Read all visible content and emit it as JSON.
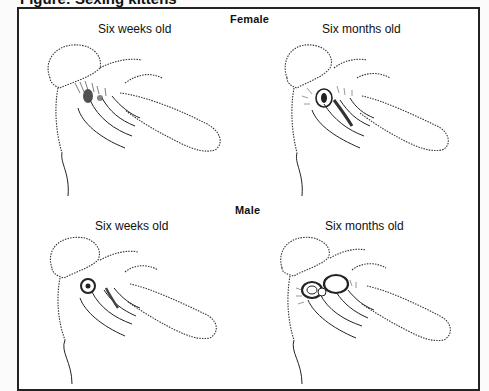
{
  "figure": {
    "title_cropped": "Figure: Sexing kittens",
    "sections": [
      {
        "label": "Female",
        "panels": [
          {
            "label": "Six weeks old"
          },
          {
            "label": "Six months old"
          }
        ]
      },
      {
        "label": "Male",
        "panels": [
          {
            "label": "Six weeks old"
          },
          {
            "label": "Six months old"
          }
        ]
      }
    ]
  }
}
